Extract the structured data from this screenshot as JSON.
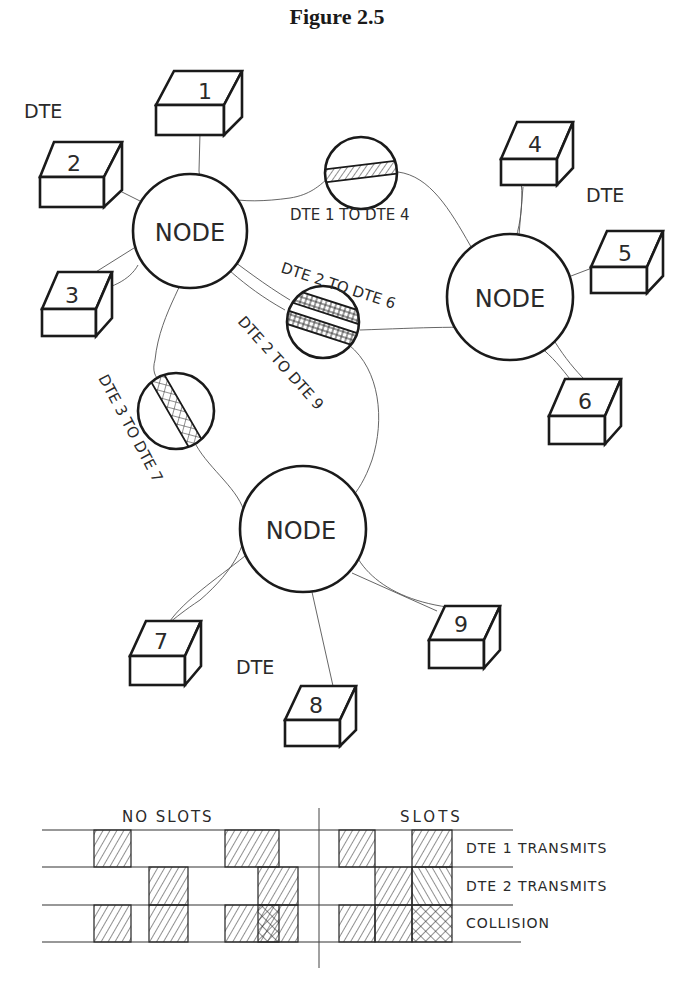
{
  "figure": {
    "title": "Figure 2.5"
  },
  "network": {
    "nodes": [
      {
        "id": "node-a",
        "label": "NODE",
        "cx": 190,
        "cy": 231,
        "r": 57
      },
      {
        "id": "node-b",
        "label": "NODE",
        "cx": 510,
        "cy": 297,
        "r": 63
      },
      {
        "id": "node-c",
        "label": "NODE",
        "cx": 303,
        "cy": 529,
        "r": 63
      }
    ],
    "dte_group_labels": [
      {
        "text": "DTE",
        "x": 24,
        "y": 118
      },
      {
        "text": "DTE",
        "x": 586,
        "y": 202
      },
      {
        "text": "DTE",
        "x": 236,
        "y": 674
      }
    ],
    "terminals": [
      {
        "number": "1",
        "x": 168,
        "y": 71
      },
      {
        "number": "2",
        "x": 40,
        "y": 142
      },
      {
        "number": "3",
        "x": 41,
        "y": 272
      },
      {
        "number": "4",
        "x": 500,
        "y": 122
      },
      {
        "number": "5",
        "x": 591,
        "y": 231
      },
      {
        "number": "6",
        "x": 548,
        "y": 379
      },
      {
        "number": "7",
        "x": 128,
        "y": 621
      },
      {
        "number": "8",
        "x": 284,
        "y": 686
      },
      {
        "number": "9",
        "x": 427,
        "y": 606
      }
    ],
    "connections": [
      {
        "label": "DTE 1 TO DTE 4",
        "pattern": "diagonal-hatch",
        "cx": 361,
        "cy": 173
      },
      {
        "label": "DTE 2 TO DTE 6",
        "pattern": "grid-hatch",
        "cx": 323,
        "cy": 322
      },
      {
        "label": "DTE 2 TO DTE 9",
        "pattern": "grid-hatch",
        "cx": 323,
        "cy": 322
      },
      {
        "label": "DTE 3 TO DTE 7",
        "pattern": "cross-hatch",
        "cx": 176,
        "cy": 411
      }
    ],
    "connection_labels": {
      "dte1_dte4": "DTE 1 TO DTE 4",
      "dte2_dte6": "DTE 2  TO DTE  6",
      "dte2_dte9": "DTE  2  TO  DTE  9",
      "dte3_dte7": "DTE  3  TO  DTE  7"
    }
  },
  "timing_diagram": {
    "section_labels": {
      "no_slots": "NO SLOTS",
      "slots": "SLOTS"
    },
    "rows": [
      {
        "label": "DTE 1  TRANSMITS"
      },
      {
        "label": "DTE 2  TRANSMITS"
      },
      {
        "label": "COLLISION"
      }
    ],
    "no_slots": {
      "dte1": [
        [
          94,
          131
        ],
        [
          225,
          279
        ]
      ],
      "dte2": [
        [
          149,
          188
        ],
        [
          258,
          298
        ]
      ],
      "collision_overlap": [
        [
          258,
          279
        ]
      ]
    },
    "slots": {
      "slot_edges": [
        339,
        375,
        412,
        452
      ],
      "dte1": [
        1,
        3
      ],
      "dte2": [
        2,
        3
      ],
      "collision_slot": 3
    }
  }
}
